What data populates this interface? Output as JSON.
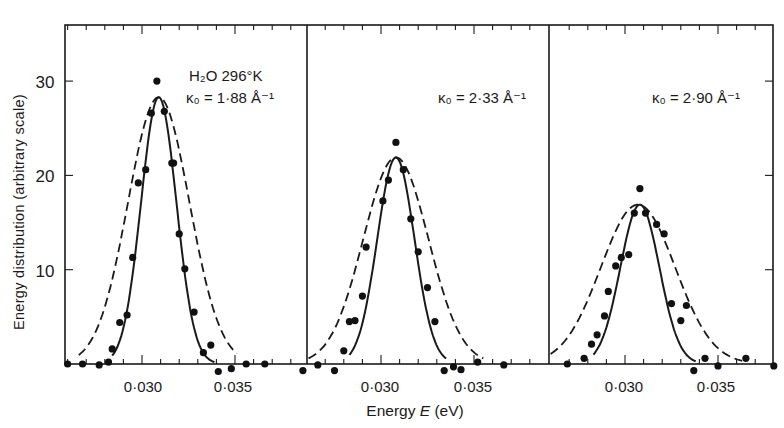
{
  "chart_data": {
    "type": "scatter",
    "title": "",
    "xlabel": "Energy E (eV)",
    "ylabel": "Energy distribution (arbitrary scale)",
    "ylim": [
      0,
      35
    ],
    "yticks": [
      10,
      20,
      30
    ],
    "xticks": [
      0.03,
      0.035
    ],
    "xtick_labels": [
      "0·030",
      "0·035"
    ],
    "minor_xtick_step": 0.001,
    "grid": false,
    "legend": "none (solid line, dashed line, and filled-circle data points)",
    "panels": [
      {
        "annotation_line1": "H₂O 296°K",
        "annotation_line2": "κ₀ = 1·88 Å⁻¹",
        "xlim": [
          0.026,
          0.0372
        ],
        "series": [
          {
            "name": "data",
            "style": "points",
            "x": [
              0.026,
              0.0268,
              0.0277,
              0.0282,
              0.0284,
              0.0288,
              0.0292,
              0.0295,
              0.0298,
              0.0302,
              0.0305,
              0.0308,
              0.0312,
              0.0316,
              0.0317,
              0.032,
              0.0323,
              0.0328,
              0.0333,
              0.0337,
              0.0341,
              0.0348,
              0.0356,
              0.0366
            ],
            "y": [
              0,
              0,
              -0.1,
              0.2,
              1.6,
              4.4,
              5.2,
              11.3,
              19.2,
              20.6,
              26.6,
              30.0,
              26.8,
              21.3,
              21.3,
              13.8,
              10.1,
              5.5,
              1.2,
              2.0,
              -0.8,
              -0.5,
              0,
              0
            ]
          },
          {
            "name": "solid-curve",
            "style": "solid",
            "center": 0.0309,
            "peak": 28.3,
            "x_start": 0.0284,
            "x_end": 0.0339,
            "width_sigma": 0.00095
          },
          {
            "name": "dashed-curve",
            "style": "dashed",
            "center": 0.0309,
            "peak": 28.3,
            "x_start": 0.0266,
            "x_end": 0.0351,
            "width_sigma": 0.00165
          }
        ]
      },
      {
        "annotation_line1": "",
        "annotation_line2": "κ₀ = 2·33 Å⁻¹",
        "xlim": [
          0.0256,
          0.0386
        ],
        "series": [
          {
            "name": "data",
            "style": "points",
            "x": [
              0.0258,
              0.0266,
              0.0275,
              0.028,
              0.0283,
              0.0286,
              0.029,
              0.0292,
              0.0301,
              0.0304,
              0.0308,
              0.0312,
              0.0316,
              0.032,
              0.0325,
              0.0329,
              0.0334,
              0.0339,
              0.0343,
              0.0352,
              0.0366
            ],
            "y": [
              -0.7,
              -0.1,
              -0.7,
              1.4,
              4.5,
              4.6,
              7.2,
              12.4,
              17.3,
              19.5,
              23.5,
              20.6,
              15.4,
              11.9,
              8.1,
              4.5,
              -0.7,
              -0.3,
              -0.6,
              0.2,
              -0.1
            ]
          },
          {
            "name": "solid-curve",
            "style": "solid",
            "center": 0.0308,
            "peak": 21.9,
            "x_start": 0.0283,
            "x_end": 0.0335,
            "width_sigma": 0.001
          },
          {
            "name": "dashed-curve",
            "style": "dashed",
            "center": 0.0308,
            "peak": 21.9,
            "x_start": 0.0261,
            "x_end": 0.0355,
            "width_sigma": 0.00175
          }
        ]
      },
      {
        "annotation_line1": "",
        "annotation_line2": "κ₀ = 2·90 Å⁻¹",
        "xlim": [
          0.0259,
          0.038
        ],
        "series": [
          {
            "name": "data",
            "style": "points",
            "x": [
              0.0269,
              0.0278,
              0.0282,
              0.0285,
              0.0289,
              0.0291,
              0.0295,
              0.0298,
              0.0302,
              0.0305,
              0.0308,
              0.0311,
              0.0317,
              0.0321,
              0.0325,
              0.033,
              0.0333,
              0.0337,
              0.0343,
              0.035,
              0.0365,
              0.038
            ],
            "y": [
              0,
              0.6,
              2.1,
              3.1,
              5.1,
              7.7,
              10.4,
              11.3,
              11.6,
              16.0,
              18.6,
              16.0,
              14.8,
              13.8,
              6.4,
              4.6,
              6.2,
              -0.7,
              0.6,
              -0.2,
              0.6,
              -0.2
            ]
          },
          {
            "name": "solid-curve",
            "style": "solid",
            "center": 0.0308,
            "peak": 16.9,
            "x_start": 0.0283,
            "x_end": 0.0338,
            "width_sigma": 0.00105
          },
          {
            "name": "dashed-curve",
            "style": "dashed",
            "center": 0.0307,
            "peak": 16.9,
            "x_start": 0.026,
            "x_end": 0.0363,
            "width_sigma": 0.002
          }
        ]
      }
    ]
  },
  "labels": {
    "ylabel": "Energy distribution  (arbitrary scale)",
    "xlabel_prefix": "Energy ",
    "xlabel_var": "E",
    "xlabel_unit": " (eV)",
    "ytick_30": "30",
    "ytick_20": "20",
    "ytick_10": "10",
    "xtick_030": "0·030",
    "xtick_035": "0·035",
    "panel1_line1": "H₂O 296°K",
    "panel1_line2": "κ₀ = 1·88 Å⁻¹",
    "panel2_line2": "κ₀ = 2·33 Å⁻¹",
    "panel3_line2": "κ₀ = 2·90 Å⁻¹"
  }
}
